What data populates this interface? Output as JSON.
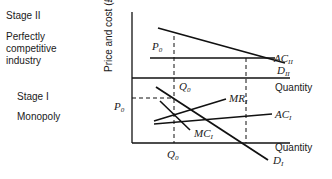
{
  "stages": {
    "stage2": {
      "title": "Stage II",
      "description": [
        "Perfectly",
        "competitive",
        "industry"
      ]
    },
    "stage1": {
      "title": "Stage I",
      "description": "Monopoly"
    }
  },
  "axes": {
    "y_label": "Price and cost (£)",
    "x_label_upper": "Quantity",
    "x_label_lower": "Quantity"
  },
  "upper_panel": {
    "price_label": "P",
    "price_sub": "0",
    "quantity_label": "Q",
    "quantity_sub": "0",
    "curves": [
      {
        "name": "AC",
        "sub": "II"
      },
      {
        "name": "D",
        "sub": "II"
      }
    ]
  },
  "lower_panel": {
    "price_label": "P",
    "price_sub": "0",
    "quantity_label": "Q",
    "quantity_sub": "0",
    "curves": [
      {
        "name": "MR",
        "sub": "I"
      },
      {
        "name": "AC",
        "sub": "I"
      },
      {
        "name": "MC",
        "sub": "I"
      },
      {
        "name": "D",
        "sub": "I"
      }
    ]
  }
}
